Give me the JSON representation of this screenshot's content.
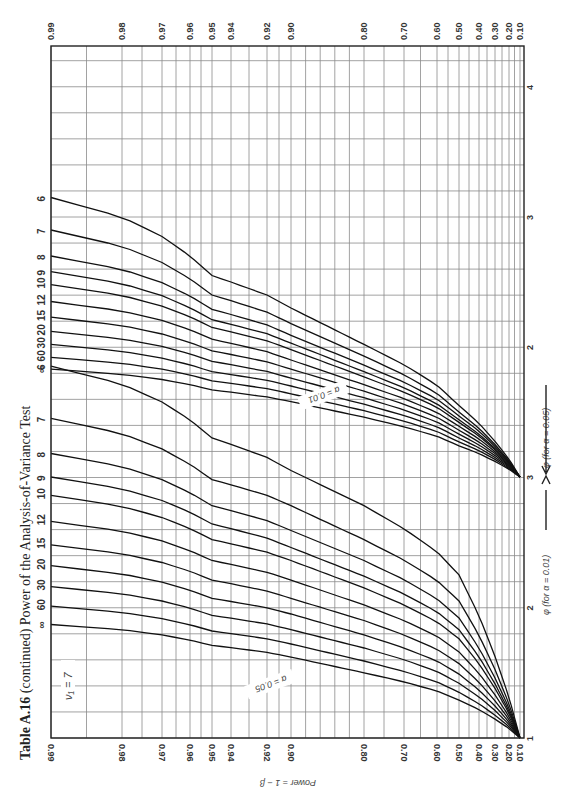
{
  "title": {
    "bold": "Table A.16",
    "rest": " (continued) Power of the Analysis-of-Variance Test"
  },
  "labels": {
    "nu1": "ν₁ = 7",
    "nu2_prefix": "ν₂ = ∞",
    "alpha_05": "α = 0.05",
    "alpha_01": "α = 0.01",
    "phi_05": "φ (for α = 0.05)",
    "phi_01": "φ (for α = 0.01)",
    "power_axis": "Power = 1 − β"
  },
  "chart_data": {
    "type": "line",
    "title": "Table A.16 (continued) Power of the Analysis-of-Variance Test",
    "subtitle": "ν₁ = 7",
    "orientation": "rotated 90° counter-clockwise (phi runs bottom→top, power runs left→right)",
    "xlabel": "φ",
    "ylabel": "Power = 1 − β",
    "power_ticks": [
      "0.99",
      "0.98",
      "0.97",
      "0.96",
      "0.95",
      "0.94",
      "0.92",
      "0.90",
      "0.80",
      "0.70",
      "0.60",
      "0.50",
      "0.40",
      "0.30",
      "0.20",
      "0.10"
    ],
    "phi_ticks_alpha_0_01": [
      "1",
      "2",
      "3"
    ],
    "phi_ticks_alpha_0_05": [
      "1",
      "2",
      "3",
      "4"
    ],
    "grid": true,
    "nu2_values": [
      "6",
      "7",
      "8",
      "9",
      "10",
      "12",
      "15",
      "20",
      "30",
      "60",
      "∞"
    ],
    "series_alpha_0_05": [
      {
        "name": "ν₂=6",
        "phi_at_power": {
          "0.10": 1.0,
          "0.50": 1.55,
          "0.80": 2.02,
          "0.90": 2.3,
          "0.95": 2.55,
          "0.99": 3.15
        }
      },
      {
        "name": "ν₂=7",
        "phi_at_power": {
          "0.10": 1.0,
          "0.50": 1.5,
          "0.80": 1.93,
          "0.90": 2.18,
          "0.95": 2.4,
          "0.99": 2.9
        }
      },
      {
        "name": "ν₂=8",
        "phi_at_power": {
          "0.10": 1.0,
          "0.50": 1.47,
          "0.80": 1.86,
          "0.90": 2.09,
          "0.95": 2.29,
          "0.99": 2.7
        }
      },
      {
        "name": "ν₂=9",
        "phi_at_power": {
          "0.10": 1.0,
          "0.50": 1.44,
          "0.80": 1.81,
          "0.90": 2.03,
          "0.95": 2.21,
          "0.99": 2.58
        }
      },
      {
        "name": "ν₂=10",
        "phi_at_power": {
          "0.10": 1.0,
          "0.50": 1.42,
          "0.80": 1.77,
          "0.90": 1.98,
          "0.95": 2.15,
          "0.99": 2.48
        }
      },
      {
        "name": "ν₂=12",
        "phi_at_power": {
          "0.10": 1.0,
          "0.50": 1.39,
          "0.80": 1.71,
          "0.90": 1.9,
          "0.95": 2.06,
          "0.99": 2.35
        }
      },
      {
        "name": "ν₂=15",
        "phi_at_power": {
          "0.10": 1.0,
          "0.50": 1.36,
          "0.80": 1.66,
          "0.90": 1.83,
          "0.95": 1.97,
          "0.99": 2.23
        }
      },
      {
        "name": "ν₂=20",
        "phi_at_power": {
          "0.10": 1.0,
          "0.50": 1.33,
          "0.80": 1.61,
          "0.90": 1.76,
          "0.95": 1.89,
          "0.99": 2.12
        }
      },
      {
        "name": "ν₂=30",
        "phi_at_power": {
          "0.10": 1.0,
          "0.50": 1.3,
          "0.80": 1.56,
          "0.90": 1.7,
          "0.95": 1.81,
          "0.99": 2.02
        }
      },
      {
        "name": "ν₂=60",
        "phi_at_power": {
          "0.10": 1.0,
          "0.50": 1.27,
          "0.80": 1.51,
          "0.90": 1.64,
          "0.95": 1.74,
          "0.99": 1.92
        }
      },
      {
        "name": "ν₂=∞",
        "phi_at_power": {
          "0.10": 1.0,
          "0.50": 1.24,
          "0.80": 1.46,
          "0.90": 1.58,
          "0.95": 1.67,
          "0.99": 1.83
        }
      }
    ],
    "series_alpha_0_01": [
      {
        "name": "ν₂=6",
        "phi_at_power": {
          "0.10": 1.0,
          "0.50": 2.25,
          "0.80": 2.78,
          "0.90": 3.05,
          "0.95": 3.3,
          "0.99": 3.85
        }
      },
      {
        "name": "ν₂=7",
        "phi_at_power": {
          "0.10": 1.0,
          "0.50": 2.05,
          "0.80": 2.52,
          "0.90": 2.78,
          "0.95": 2.98,
          "0.99": 3.45
        }
      },
      {
        "name": "ν₂=8",
        "phi_at_power": {
          "0.10": 1.0,
          "0.50": 1.92,
          "0.80": 2.36,
          "0.90": 2.59,
          "0.95": 2.78,
          "0.99": 3.18
        }
      },
      {
        "name": "ν₂=9",
        "phi_at_power": {
          "0.10": 1.0,
          "0.50": 1.83,
          "0.80": 2.24,
          "0.90": 2.46,
          "0.95": 2.64,
          "0.99": 3.0
        }
      },
      {
        "name": "ν₂=10",
        "phi_at_power": {
          "0.10": 1.0,
          "0.50": 1.76,
          "0.80": 2.15,
          "0.90": 2.36,
          "0.95": 2.52,
          "0.99": 2.86
        }
      },
      {
        "name": "ν₂=12",
        "phi_at_power": {
          "0.10": 1.0,
          "0.50": 1.66,
          "0.80": 2.02,
          "0.90": 2.21,
          "0.95": 2.36,
          "0.99": 2.66
        }
      },
      {
        "name": "ν₂=15",
        "phi_at_power": {
          "0.10": 1.0,
          "0.50": 1.57,
          "0.80": 1.9,
          "0.90": 2.07,
          "0.95": 2.21,
          "0.99": 2.48
        }
      },
      {
        "name": "ν₂=20",
        "phi_at_power": {
          "0.10": 1.0,
          "0.50": 1.49,
          "0.80": 1.79,
          "0.90": 1.95,
          "0.95": 2.07,
          "0.99": 2.32
        }
      },
      {
        "name": "ν₂=30",
        "phi_at_power": {
          "0.10": 1.0,
          "0.50": 1.42,
          "0.80": 1.69,
          "0.90": 1.83,
          "0.95": 1.94,
          "0.99": 2.16
        }
      },
      {
        "name": "ν₂=60",
        "phi_at_power": {
          "0.10": 1.0,
          "0.50": 1.35,
          "0.80": 1.59,
          "0.90": 1.72,
          "0.95": 1.82,
          "0.99": 2.01
        }
      },
      {
        "name": "ν₂=∞",
        "phi_at_power": {
          "0.10": 1.0,
          "0.50": 1.29,
          "0.80": 1.5,
          "0.90": 1.62,
          "0.95": 1.71,
          "0.99": 1.87
        }
      }
    ]
  }
}
